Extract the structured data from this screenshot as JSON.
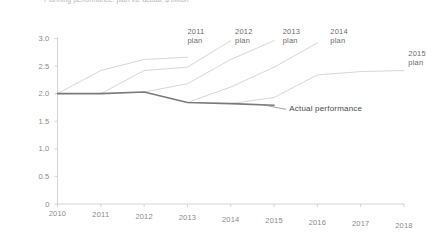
{
  "chart_data": {
    "type": "line",
    "title": "Planning performance: plan vs. actual, $ billion",
    "xlabel": "",
    "ylabel": "",
    "x": [
      2010,
      2011,
      2012,
      2013,
      2014,
      2015,
      2016,
      2017,
      2018
    ],
    "xlim": [
      2010,
      2018
    ],
    "ylim": [
      0,
      3.0
    ],
    "yticks": [
      "0",
      "0.5",
      "1.0",
      "1.5",
      "2.0",
      "2.5",
      "3.0"
    ],
    "ytick_values": [
      0,
      0.5,
      1.0,
      1.5,
      2.0,
      2.5,
      3.0
    ],
    "xticks": [
      "2010",
      "2011",
      "2012",
      "2013",
      "2014",
      "2015",
      "2016",
      "2017",
      "2018"
    ],
    "grid": false,
    "legend": "inline annotations",
    "annotations": [
      {
        "label": "2011\nplan",
        "x": 2013.0,
        "y": 3.02
      },
      {
        "label": "2012\nplan",
        "x": 2014.1,
        "y": 3.02
      },
      {
        "label": "2013\nplan",
        "x": 2015.2,
        "y": 3.02
      },
      {
        "label": "2014\nplan",
        "x": 2016.3,
        "y": 3.02
      },
      {
        "label": "2015\nplan",
        "x": 2018.1,
        "y": 2.62
      },
      {
        "label": "Actual performance",
        "x": 2015.35,
        "y": 1.72
      }
    ],
    "series": [
      {
        "name": "Actual performance",
        "color": "#7a7a7a",
        "width": 1.6,
        "points": [
          [
            2010,
            2.0
          ],
          [
            2011,
            2.0
          ],
          [
            2012,
            2.03
          ],
          [
            2013,
            1.84
          ],
          [
            2014,
            1.82
          ],
          [
            2015,
            1.79
          ]
        ]
      },
      {
        "name": "2011 plan",
        "color": "#c4c4c4",
        "width": 0.7,
        "points": [
          [
            2010,
            2.0
          ],
          [
            2011,
            2.42
          ],
          [
            2012,
            2.62
          ],
          [
            2013,
            2.66
          ]
        ]
      },
      {
        "name": "2012 plan",
        "color": "#c4c4c4",
        "width": 0.7,
        "points": [
          [
            2011,
            2.0
          ],
          [
            2012,
            2.42
          ],
          [
            2013,
            2.48
          ],
          [
            2014,
            2.96
          ]
        ]
      },
      {
        "name": "2013 plan",
        "color": "#c4c4c4",
        "width": 0.7,
        "points": [
          [
            2012,
            2.03
          ],
          [
            2013,
            2.18
          ],
          [
            2014,
            2.62
          ],
          [
            2015,
            2.96
          ]
        ]
      },
      {
        "name": "2014 plan",
        "color": "#c4c4c4",
        "width": 0.7,
        "points": [
          [
            2013,
            1.84
          ],
          [
            2014,
            2.12
          ],
          [
            2015,
            2.48
          ],
          [
            2016,
            2.92
          ]
        ]
      },
      {
        "name": "2015 plan",
        "color": "#c4c4c4",
        "width": 0.7,
        "points": [
          [
            2014,
            1.82
          ],
          [
            2015,
            1.93
          ],
          [
            2016,
            2.34
          ],
          [
            2017,
            2.4
          ],
          [
            2018,
            2.42
          ]
        ]
      }
    ],
    "leader_line": {
      "from": [
        2014.72,
        1.8
      ],
      "to": [
        2015.28,
        1.715
      ]
    },
    "axis_color": "#c9c9c9"
  }
}
